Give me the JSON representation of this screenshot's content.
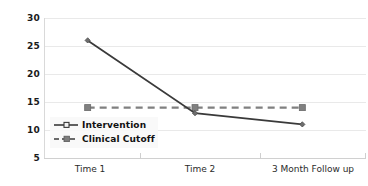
{
  "chart_data": {
    "type": "line",
    "title": "",
    "xlabel": "",
    "ylabel": "",
    "categories": [
      "Time 1",
      "Time 2",
      "3 Month Follow up"
    ],
    "ylim": [
      5,
      30
    ],
    "yticks": [
      30,
      25,
      20,
      15,
      10,
      5
    ],
    "grid": true,
    "legend_position": "inside lower-left",
    "series": [
      {
        "name": "Intervention",
        "values": [
          26,
          13,
          11
        ],
        "color": "#3a3a3a",
        "style": "solid",
        "marker": "diamond"
      },
      {
        "name": "Clinical Cutoff",
        "values": [
          14,
          14,
          14
        ],
        "color": "#808080",
        "style": "dashed",
        "marker": "square"
      }
    ]
  },
  "legend": {
    "items": [
      {
        "label": "Intervention"
      },
      {
        "label": "Clinical Cutoff"
      }
    ]
  },
  "axis": {
    "y_labels": [
      "30",
      "25",
      "20",
      "15",
      "10",
      "5"
    ],
    "x_labels": [
      "Time 1",
      "Time 2",
      "3 Month Follow up"
    ]
  }
}
